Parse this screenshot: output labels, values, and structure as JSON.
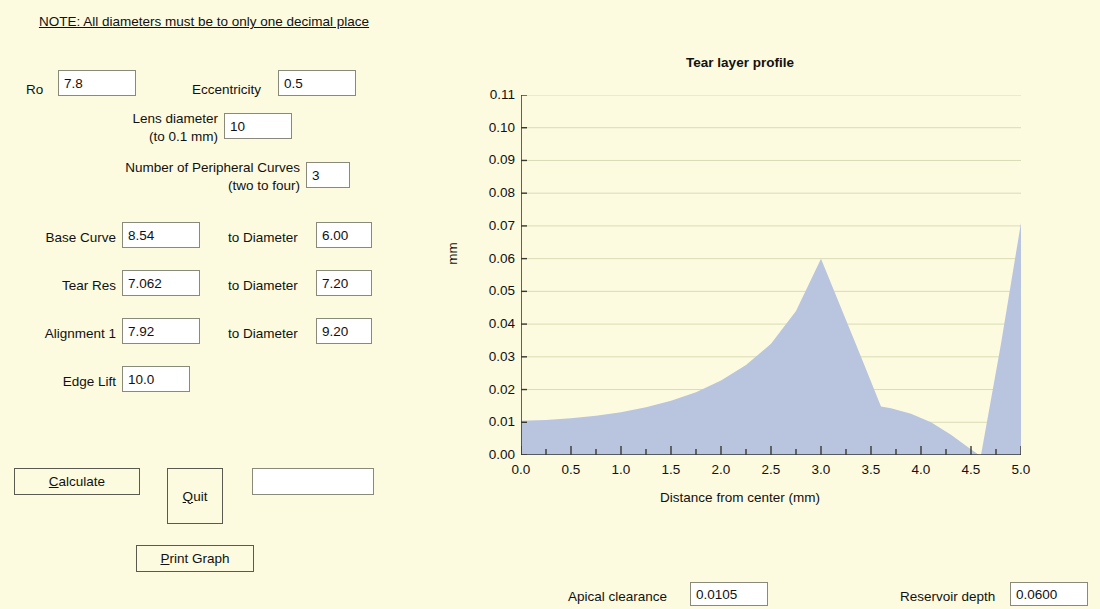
{
  "window": {
    "background_color": "#fcfbe0"
  },
  "note": {
    "text": "NOTE: All diameters must be to only one decimal place"
  },
  "form": {
    "ro_label": "Ro",
    "ro_value": "7.8",
    "eccentricity_label": "Eccentricity",
    "eccentricity_value": "0.5",
    "lens_diameter_label_line1": "Lens diameter",
    "lens_diameter_label_line2": "(to 0.1 mm)",
    "lens_diameter_value": "10",
    "peripheral_curves_label_line1": "Number of Peripheral Curves",
    "peripheral_curves_label_line2": "(two to four)",
    "peripheral_curves_value": "3",
    "rows": [
      {
        "label": "Base Curve",
        "value": "8.54",
        "diam_label": "to Diameter",
        "diam_value": "6.00"
      },
      {
        "label": "Tear Res",
        "value": "7.062",
        "diam_label": "to Diameter",
        "diam_value": "7.20"
      },
      {
        "label": "Alignment 1",
        "value": "7.92",
        "diam_label": "to Diameter",
        "diam_value": "9.20"
      },
      {
        "label": "Edge Lift",
        "value": "10.0",
        "diam_label": "",
        "diam_value": ""
      }
    ]
  },
  "buttons": {
    "calculate": {
      "accel": "C",
      "rest": "alculate"
    },
    "quit": {
      "accel": "Q",
      "rest": "uit"
    },
    "print_graph": {
      "accel": "P",
      "rest": "rint Graph"
    },
    "message_field_value": ""
  },
  "status": {
    "apical_clearance_label": "Apical clearance",
    "apical_clearance_value": "0.0105",
    "reservoir_depth_label": "Reservoir depth",
    "reservoir_depth_value": "0.0600"
  },
  "chart_data": {
    "type": "area",
    "title": "Tear layer profile",
    "xlabel": "Distance from center (mm)",
    "ylabel": "mm",
    "xlim": [
      0.0,
      5.0
    ],
    "ylim": [
      0.0,
      0.11
    ],
    "grid": true,
    "legend": "none",
    "xticks": [
      "0.0",
      "0.5",
      "1.0",
      "1.5",
      "2.0",
      "2.5",
      "3.0",
      "3.5",
      "4.0",
      "4.5",
      "5.0"
    ],
    "xtick_values": [
      0.0,
      0.5,
      1.0,
      1.5,
      2.0,
      2.5,
      3.0,
      3.5,
      4.0,
      4.5,
      5.0
    ],
    "xminor_step": 0.25,
    "yticks": [
      "0.00",
      "0.01",
      "0.02",
      "0.03",
      "0.04",
      "0.05",
      "0.06",
      "0.07",
      "0.08",
      "0.09",
      "0.10",
      "0.11"
    ],
    "ytick_values": [
      0.0,
      0.01,
      0.02,
      0.03,
      0.04,
      0.05,
      0.06,
      0.07,
      0.08,
      0.09,
      0.1,
      0.11
    ],
    "fill_color": "#b9c4de",
    "grid_color": "#d8dcb4",
    "series": [
      {
        "name": "Tear layer thickness",
        "x": [
          0.0,
          0.25,
          0.5,
          0.75,
          1.0,
          1.25,
          1.5,
          1.75,
          2.0,
          2.25,
          2.5,
          2.75,
          3.0,
          3.2,
          3.4,
          3.6,
          3.7,
          3.9,
          4.1,
          4.3,
          4.45,
          4.58,
          4.6,
          4.8,
          5.0
        ],
        "y": [
          0.0105,
          0.0107,
          0.0112,
          0.012,
          0.0131,
          0.0146,
          0.0166,
          0.0192,
          0.0228,
          0.0275,
          0.034,
          0.044,
          0.06,
          0.045,
          0.03,
          0.0148,
          0.0143,
          0.0126,
          0.01,
          0.0062,
          0.0028,
          0.0,
          0.0,
          0.034,
          0.071
        ]
      }
    ],
    "annotations": [
      {
        "name": "apical-clearance",
        "value": 0.0105
      },
      {
        "name": "reservoir-depth",
        "value": 0.06
      }
    ]
  }
}
